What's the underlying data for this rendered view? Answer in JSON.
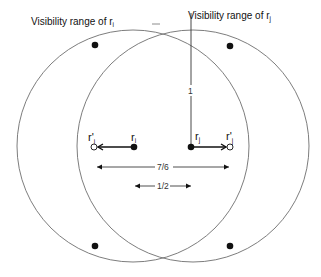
{
  "diagram": {
    "type": "robot-visibility-geometry",
    "labels": {
      "range_i_prefix": "Visibility range of r",
      "range_i_sub": "i",
      "range_j_prefix": "Visibility range of r",
      "range_j_sub": "j",
      "ri": "r",
      "ri_sub": "i",
      "rj": "r",
      "rj_sub": "j",
      "ri_prime": "r'",
      "ri_prime_sub": "i",
      "rj_prime": "r'",
      "rj_prime_sub": "j",
      "vertical_distance": "1",
      "outer_distance": "7/6",
      "inner_distance": "1/2"
    },
    "circles": [
      {
        "name": "visibility-range-ri",
        "cx": 133,
        "cy": 146,
        "r": 116,
        "stroke": "#6e6e6e"
      },
      {
        "name": "visibility-range-rj",
        "cx": 193,
        "cy": 146,
        "r": 116,
        "stroke": "#6e6e6e"
      }
    ],
    "points": {
      "ri": {
        "x": 134,
        "y": 147,
        "filled": true
      },
      "rj": {
        "x": 191,
        "y": 147,
        "filled": true
      },
      "ri_prime": {
        "x": 94,
        "y": 147,
        "filled": false
      },
      "rj_prime": {
        "x": 230,
        "y": 147,
        "filled": false
      },
      "corner_dots": [
        {
          "x": 95,
          "y": 45
        },
        {
          "x": 230,
          "y": 46
        },
        {
          "x": 95,
          "y": 246
        },
        {
          "x": 230,
          "y": 246
        }
      ]
    },
    "colors": {
      "ink": "#111111",
      "circle_stroke": "#6e6e6e",
      "background": "#ffffff"
    }
  }
}
